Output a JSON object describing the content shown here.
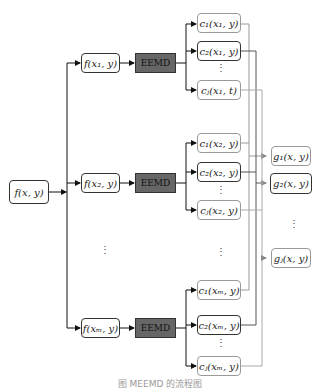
{
  "diagram": {
    "type": "flowchart",
    "input": {
      "label": "f(x, y)"
    },
    "slices": [
      {
        "label": "f(x₁, y)",
        "decomp": "EEMD",
        "components": [
          "c₁(x₁, y)",
          "c₂(x₁, y)",
          "cⱼ(x₁, t)"
        ]
      },
      {
        "label": "f(x₂, y)",
        "decomp": "EEMD",
        "components": [
          "c₁(x₂, y)",
          "c₂(x₂, y)",
          "cⱼ(x₂, y)"
        ]
      },
      {
        "label": "f(xₘ, y)",
        "decomp": "EEMD",
        "components": [
          "c₁(xₘ, y)",
          "c₂(xₘ, y)",
          "cⱼ(xₘ, y)"
        ]
      }
    ],
    "outputs": [
      "g₁(x, y)",
      "g₂(x, y)",
      "gⱼ(x, y)"
    ],
    "ellipsis": "⋮",
    "caption": "图  MEEMD 的流程图"
  }
}
